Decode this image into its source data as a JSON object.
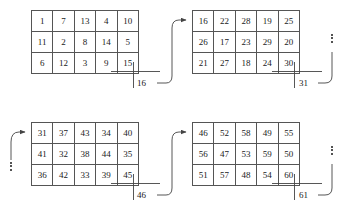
{
  "diagram": {
    "grid_rows": 3,
    "grid_cols": 5,
    "line_color": "#555555",
    "text_color": "#1a1a1a",
    "background": "#ffffff",
    "grids": [
      {
        "id": "grid-1",
        "rows": [
          [
            "1",
            "7",
            "13",
            "4",
            "10"
          ],
          [
            "11",
            "2",
            "8",
            "14",
            "5"
          ],
          [
            "6",
            "12",
            "3",
            "9",
            "15"
          ]
        ]
      },
      {
        "id": "grid-2",
        "rows": [
          [
            "16",
            "22",
            "28",
            "19",
            "25"
          ],
          [
            "26",
            "17",
            "23",
            "29",
            "20"
          ],
          [
            "21",
            "27",
            "18",
            "24",
            "30"
          ]
        ]
      },
      {
        "id": "grid-3",
        "rows": [
          [
            "31",
            "37",
            "43",
            "34",
            "40"
          ],
          [
            "41",
            "32",
            "38",
            "44",
            "35"
          ],
          [
            "36",
            "42",
            "33",
            "39",
            "45"
          ]
        ]
      },
      {
        "id": "grid-4",
        "rows": [
          [
            "46",
            "52",
            "58",
            "49",
            "55"
          ],
          [
            "56",
            "47",
            "53",
            "59",
            "50"
          ],
          [
            "51",
            "57",
            "48",
            "54",
            "60"
          ]
        ]
      }
    ],
    "connector_labels": {
      "grid1_to_grid2": "16",
      "grid2_continue": "31",
      "grid3_to_grid4": "46",
      "grid4_continue": "61"
    }
  }
}
